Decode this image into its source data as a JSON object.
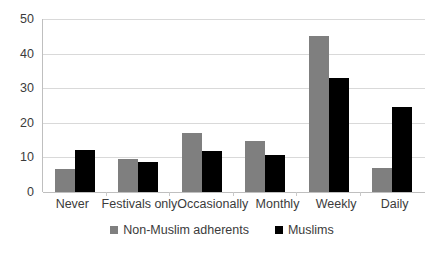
{
  "chart_data": {
    "type": "bar",
    "title": "",
    "subtitle": "",
    "xlabel": "",
    "ylabel": "",
    "ylim": [
      0,
      50
    ],
    "yticks": [
      0,
      10,
      20,
      30,
      40,
      50
    ],
    "grid": true,
    "legend_position": "bottom",
    "categories": [
      "Never",
      "Festivals only",
      "Occasionally",
      "Monthly",
      "Weekly",
      "Daily"
    ],
    "series": [
      {
        "name": "Non-Muslim adherents",
        "color": "#7f7f7f",
        "values": [
          6.6,
          9.6,
          17.1,
          14.8,
          45.1,
          7.0
        ]
      },
      {
        "name": "Muslims",
        "color": "#000000",
        "values": [
          12.1,
          8.8,
          11.9,
          10.6,
          33.0,
          24.7
        ]
      }
    ]
  },
  "axis": {
    "y_tick_labels": [
      "50",
      "40",
      "30",
      "20",
      "10",
      "0"
    ]
  },
  "legend": {
    "items": [
      {
        "label": "Non-Muslim adherents",
        "swatch": "gray-square-icon"
      },
      {
        "label": "Muslims",
        "swatch": "black-square-icon"
      }
    ]
  }
}
